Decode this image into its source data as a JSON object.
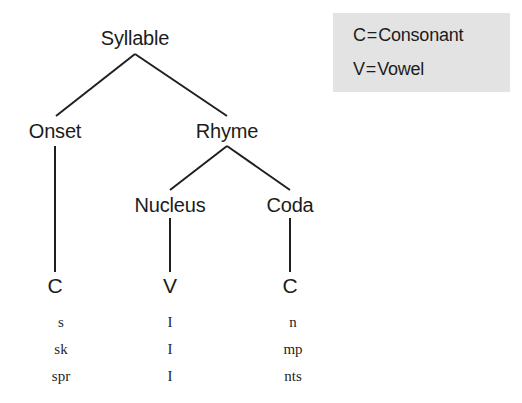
{
  "diagram": {
    "root": {
      "label": "Syllable"
    },
    "level2": [
      {
        "label": "Onset"
      },
      {
        "label": "Rhyme"
      }
    ],
    "level3": [
      {
        "label": "Nucleus"
      },
      {
        "label": "Coda"
      }
    ],
    "terminals": [
      {
        "label": "C"
      },
      {
        "label": "V"
      },
      {
        "label": "C"
      }
    ],
    "examples": {
      "rows": [
        {
          "onset": "s",
          "nucleus": "I",
          "coda": "n"
        },
        {
          "onset": "sk",
          "nucleus": "I",
          "coda": "mp"
        },
        {
          "onset": "spr",
          "nucleus": "I",
          "coda": "nts"
        }
      ]
    },
    "edge_color": "#1f1f1f"
  },
  "legend": {
    "background": "#e3e3e3",
    "entries": [
      {
        "symbol": "C",
        "equals": "=",
        "meaning": "Consonant"
      },
      {
        "symbol": "V",
        "equals": "=",
        "meaning": "Vowel"
      }
    ]
  }
}
